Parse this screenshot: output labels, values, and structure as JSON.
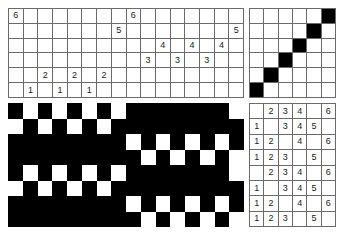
{
  "draft": {
    "title": "Weaving draft",
    "colors": {
      "ink": "#000000",
      "grid_line": "#6a6a6a",
      "background": "#ffffff"
    },
    "threading": {
      "name": "threading-draft",
      "columns": 16,
      "rows": 6,
      "row_labels": [
        "6",
        "5",
        "4",
        "3",
        "2",
        "1"
      ],
      "cells": [
        [
          "6",
          "",
          "",
          "",
          "",
          "",
          "",
          "",
          "6",
          "",
          "",
          "",
          "",
          "",
          "",
          ""
        ],
        [
          "",
          "",
          "",
          "",
          "",
          "",
          "",
          "5",
          "",
          "",
          "",
          "",
          "",
          "",
          "",
          "5"
        ],
        [
          "",
          "",
          "",
          "",
          "",
          "",
          "",
          "",
          "",
          "",
          "4",
          "",
          "4",
          "",
          "4",
          ""
        ],
        [
          "",
          "",
          "",
          "",
          "",
          "",
          "",
          "",
          "",
          "3",
          "",
          "3",
          "",
          "3",
          "",
          ""
        ],
        [
          "",
          "",
          "2",
          "",
          "2",
          "",
          "2",
          "",
          "",
          "",
          "",
          "",
          "",
          "",
          "",
          ""
        ],
        [
          "",
          "1",
          "",
          "1",
          "",
          "1",
          "",
          "",
          "",
          "",
          "",
          "",
          "",
          "",
          "",
          ""
        ]
      ]
    },
    "tieup": {
      "name": "tie-up",
      "columns": 6,
      "rows": 6,
      "filled": [
        [
          0,
          0,
          0,
          0,
          0,
          1
        ],
        [
          0,
          0,
          0,
          0,
          1,
          0
        ],
        [
          0,
          0,
          0,
          1,
          0,
          0
        ],
        [
          0,
          0,
          1,
          0,
          0,
          0
        ],
        [
          0,
          1,
          0,
          0,
          0,
          0
        ],
        [
          1,
          0,
          0,
          0,
          0,
          0
        ]
      ]
    },
    "treadling": {
      "name": "treadling-draft",
      "columns": 6,
      "rows": 8,
      "cells": [
        [
          "",
          "2",
          "3",
          "4",
          "",
          "6"
        ],
        [
          "1",
          "",
          "3",
          "4",
          "5",
          ""
        ],
        [
          "1",
          "2",
          "",
          "4",
          "",
          "6"
        ],
        [
          "1",
          "2",
          "3",
          "",
          "5",
          ""
        ],
        [
          "",
          "2",
          "3",
          "4",
          "",
          "6"
        ],
        [
          "1",
          "",
          "3",
          "4",
          "5",
          ""
        ],
        [
          "1",
          "2",
          "",
          "4",
          "",
          "6"
        ],
        [
          "1",
          "2",
          "3",
          "",
          "5",
          ""
        ]
      ]
    },
    "drawdown": {
      "name": "drawdown",
      "columns": 16,
      "rows": 8,
      "filled": [
        [
          1,
          0,
          1,
          0,
          1,
          0,
          1,
          0,
          1,
          1,
          1,
          1,
          1,
          1,
          1,
          0
        ],
        [
          0,
          1,
          0,
          1,
          0,
          1,
          0,
          1,
          1,
          1,
          1,
          1,
          1,
          1,
          1,
          1
        ],
        [
          1,
          1,
          1,
          1,
          1,
          1,
          1,
          1,
          0,
          1,
          0,
          1,
          0,
          1,
          0,
          1
        ],
        [
          1,
          1,
          1,
          1,
          1,
          1,
          1,
          1,
          1,
          0,
          1,
          0,
          1,
          0,
          1,
          0
        ],
        [
          1,
          0,
          1,
          0,
          1,
          0,
          1,
          0,
          1,
          1,
          1,
          1,
          1,
          1,
          1,
          0
        ],
        [
          0,
          1,
          0,
          1,
          0,
          1,
          0,
          1,
          1,
          1,
          1,
          1,
          1,
          1,
          1,
          1
        ],
        [
          1,
          1,
          1,
          1,
          1,
          1,
          1,
          1,
          0,
          1,
          0,
          1,
          0,
          1,
          0,
          1
        ],
        [
          1,
          1,
          1,
          1,
          1,
          1,
          1,
          1,
          1,
          0,
          1,
          0,
          1,
          0,
          1,
          0
        ]
      ]
    }
  }
}
